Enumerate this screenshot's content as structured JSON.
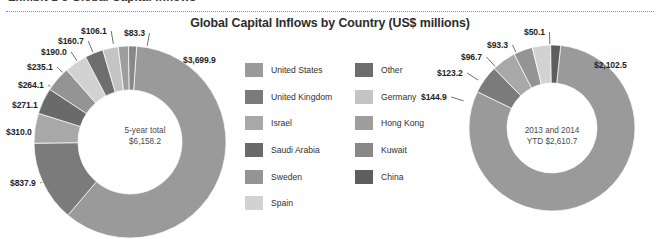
{
  "exhibit": {
    "heading": "Exhibit 1-3  Global Capital Inflows"
  },
  "chart_title": "Global Capital Inflows by Country (US$ millions)",
  "legend": {
    "column_a": [
      {
        "label": "United States",
        "color": "#9a9a9a"
      },
      {
        "label": "United Kingdom",
        "color": "#7b7b7b"
      },
      {
        "label": "Israel",
        "color": "#a8a8a8"
      },
      {
        "label": "Saudi Arabia",
        "color": "#6a6a6a"
      },
      {
        "label": "Sweden",
        "color": "#949494"
      },
      {
        "label": "Spain",
        "color": "#d2d2d2"
      }
    ],
    "column_b": [
      {
        "label": "Other",
        "color": "#6e6e6e"
      },
      {
        "label": "Germany",
        "color": "#c4c4c4"
      },
      {
        "label": "Hong Kong",
        "color": "#9e9e9e"
      },
      {
        "label": "Kuwait",
        "color": "#888888"
      },
      {
        "label": "China",
        "color": "#5e5e5e"
      }
    ]
  },
  "left_chart": {
    "center_line1": "5-year total",
    "center_line2": "$6,158.2",
    "callouts": [
      {
        "text": "$3,699.9",
        "x": 183,
        "y": 55
      },
      {
        "text": "$837.9",
        "x": 10,
        "y": 178
      },
      {
        "text": "$310.0",
        "x": 6,
        "y": 127
      },
      {
        "text": "$271.1",
        "x": 12,
        "y": 100
      },
      {
        "text": "$264.1",
        "x": 18,
        "y": 80
      },
      {
        "text": "$235.1",
        "x": 27,
        "y": 62
      },
      {
        "text": "$190.0",
        "x": 41,
        "y": 47
      },
      {
        "text": "$160.7",
        "x": 58,
        "y": 36
      },
      {
        "text": "$106.1",
        "x": 81,
        "y": 26
      },
      {
        "text": "$83.3",
        "x": 124,
        "y": 28
      }
    ]
  },
  "right_chart": {
    "center_line1": "2013 and 2014",
    "center_line2": "YTD $2,610.7",
    "callouts": [
      {
        "text": "$2,102.5",
        "x": 594,
        "y": 60
      },
      {
        "text": "$144.9",
        "x": 421,
        "y": 92
      },
      {
        "text": "$123.2",
        "x": 437,
        "y": 68
      },
      {
        "text": "$96.7",
        "x": 461,
        "y": 52
      },
      {
        "text": "$93.3",
        "x": 487,
        "y": 40
      },
      {
        "text": "$50.1",
        "x": 524,
        "y": 27
      }
    ]
  },
  "chart_data": [
    {
      "type": "pie",
      "title": "Global Capital Inflows by Country (US$ millions)",
      "subtitle": "5-year total $6,158.2",
      "total": 6158.2,
      "unit": "US$ millions",
      "donut": true,
      "legend_position": "center",
      "categories": [
        "United States",
        "United Kingdom",
        "Israel",
        "Saudi Arabia",
        "Sweden",
        "Spain",
        "Other",
        "Germany",
        "Hong Kong",
        "Kuwait"
      ],
      "values": [
        3699.9,
        837.9,
        310.0,
        271.1,
        264.1,
        235.1,
        190.0,
        160.7,
        106.1,
        83.3
      ],
      "colors": [
        "#9a9a9a",
        "#7b7b7b",
        "#a8a8a8",
        "#6a6a6a",
        "#949494",
        "#d2d2d2",
        "#6e6e6e",
        "#c4c4c4",
        "#9e9e9e",
        "#888888"
      ]
    },
    {
      "type": "pie",
      "title": "Global Capital Inflows by Country (US$ millions)",
      "subtitle": "2013 and 2014 YTD $2,610.7",
      "total": 2610.7,
      "unit": "US$ millions",
      "donut": true,
      "legend_position": "center",
      "categories": [
        "United States",
        "United Kingdom",
        "Israel",
        "Sweden",
        "Spain",
        "China"
      ],
      "values": [
        2102.5,
        144.9,
        123.2,
        96.7,
        93.3,
        50.1
      ],
      "colors": [
        "#9a9a9a",
        "#7b7b7b",
        "#a8a8a8",
        "#949494",
        "#d2d2d2",
        "#5e5e5e"
      ]
    }
  ]
}
